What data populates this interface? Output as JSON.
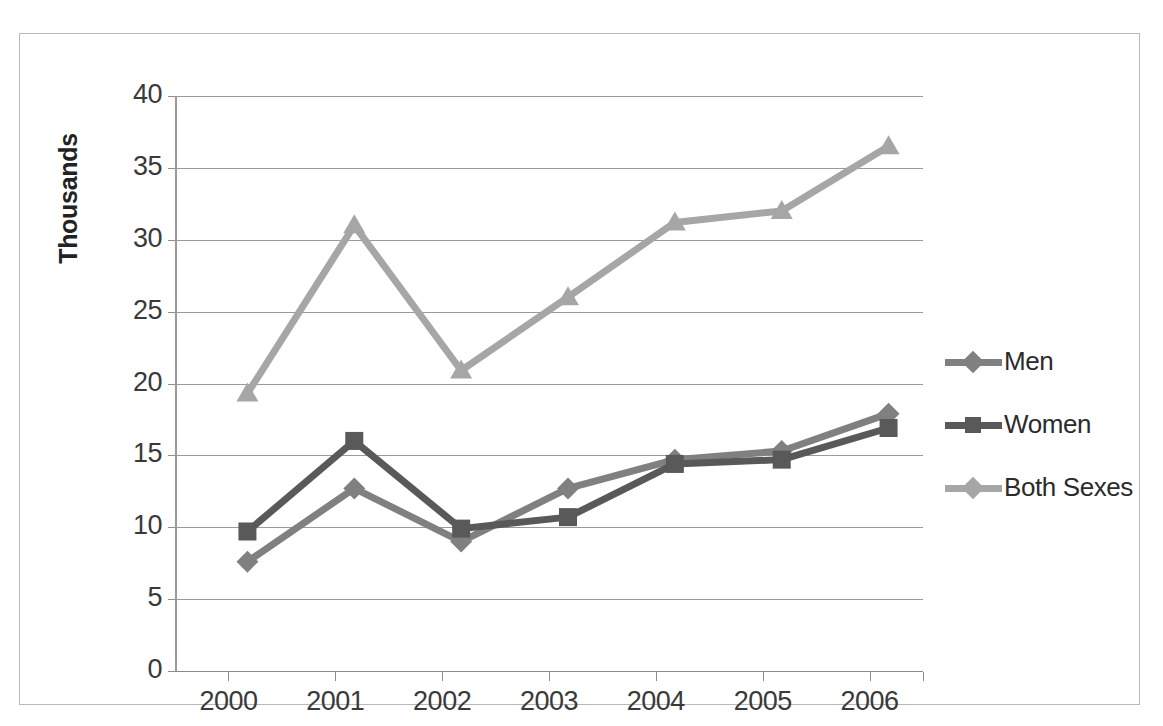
{
  "chart_data": {
    "type": "line",
    "title": "",
    "xlabel": "",
    "ylabel": "Thousands",
    "categories": [
      "2000",
      "2001",
      "2002",
      "2003",
      "2004",
      "2005",
      "2006"
    ],
    "ylim": [
      0,
      40
    ],
    "ytick_step": 5,
    "yticks": [
      "0",
      "5",
      "10",
      "15",
      "20",
      "25",
      "30",
      "35",
      "40"
    ],
    "grid": true,
    "legend_position": "right",
    "series": [
      {
        "name": "Men",
        "marker": "diamond",
        "color": "#808080",
        "values": [
          9.9,
          15.0,
          11.3,
          15.0,
          17.0,
          17.6,
          20.2
        ]
      },
      {
        "name": "Women",
        "marker": "square",
        "color": "#595959",
        "values": [
          12.0,
          18.3,
          12.2,
          13.0,
          16.7,
          17.0,
          19.2
        ]
      },
      {
        "name": "Both Sexes",
        "marker": "triangle",
        "color": "#a6a6a6",
        "values": [
          21.6,
          33.3,
          23.2,
          28.3,
          33.5,
          34.3,
          38.8
        ]
      }
    ]
  },
  "axis": {
    "y_title": "Thousands"
  },
  "legend": {
    "items": [
      {
        "label": "Men"
      },
      {
        "label": "Women"
      },
      {
        "label": "Both Sexes"
      }
    ]
  },
  "colors": {
    "men": "#808080",
    "women": "#595959",
    "both_sexes": "#a6a6a6",
    "gridline": "#9a9a9a",
    "frame": "#b9b9b9",
    "text": "#333333"
  }
}
